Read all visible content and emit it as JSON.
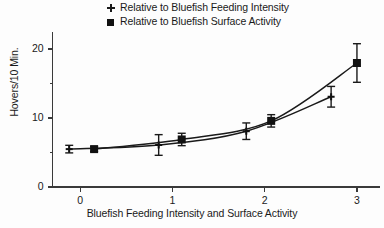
{
  "chart_data": {
    "type": "line",
    "title": "",
    "xlabel": "Bluefish Feeding Intensity and Surface Activity",
    "ylabel": "Hovers/10 Min.",
    "xlim": [
      -0.35,
      3.25
    ],
    "ylim": [
      0,
      22.5
    ],
    "xticks": [
      0,
      1,
      2,
      3
    ],
    "xtick_labels": [
      "0",
      "1",
      "2",
      "3"
    ],
    "yticks": [
      0,
      10,
      20
    ],
    "ytick_labels": [
      "0",
      "10",
      "20"
    ],
    "yminor_ticks": [
      5,
      15
    ],
    "grid": false,
    "legend_position": "top-center",
    "series": [
      {
        "name": "Relative to Bluefish Feeding Intensity",
        "marker": "plus",
        "x": [
          -0.12,
          0.85,
          1.8,
          2.72
        ],
        "values": [
          5.5,
          6.1,
          8.1,
          13.1
        ],
        "errors": [
          0.55,
          1.5,
          1.2,
          1.5
        ]
      },
      {
        "name": "Relative to Bluefish Surface Activity",
        "marker": "square",
        "x": [
          0.15,
          1.1,
          2.07,
          3.0
        ],
        "values": [
          5.5,
          6.9,
          9.6,
          18.0
        ],
        "errors": [
          0.35,
          0.9,
          0.9,
          2.8
        ]
      }
    ]
  },
  "legend": {
    "entries": [
      {
        "marker": "plus-marker",
        "label": "Relative to Bluefish Feeding Intensity"
      },
      {
        "marker": "square-marker",
        "label": "Relative to Bluefish Surface Activity"
      }
    ]
  },
  "axes": {
    "x_title": "Bluefish Feeding Intensity and Surface Activity",
    "y_title": "Hovers/10 Min.",
    "x_labels": [
      "0",
      "1",
      "2",
      "3"
    ],
    "y_labels": [
      "0",
      "10",
      "20"
    ]
  },
  "colors": {
    "ink": "#1a1a1a",
    "marker": "#111111",
    "axis": "#3a3a3a",
    "background": "#fdfdfd"
  }
}
